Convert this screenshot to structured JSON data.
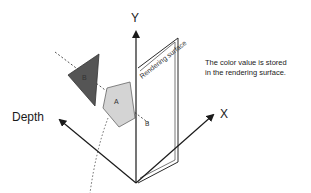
{
  "diagram": {
    "axes": {
      "y_label": "Y",
      "x_label": "X",
      "depth_label": "Depth"
    },
    "rendering_surface": {
      "label": "Rendering surface",
      "caption_line1": "The color value is stored",
      "caption_line2": "in the rendering surface."
    },
    "shapes": {
      "dark_triangle": {
        "label": "B",
        "color": "#555555"
      },
      "light_pentagon": {
        "label": "A",
        "color": "#d4d4d4"
      },
      "intersection_point": {
        "label": "B"
      }
    },
    "colors": {
      "line": "#2a2a2a",
      "dark_fill": "#555555",
      "light_fill": "#d4d4d4",
      "dashed": "#555555"
    }
  }
}
